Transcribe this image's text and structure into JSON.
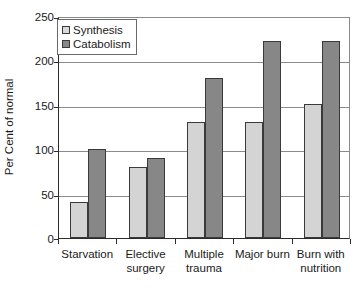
{
  "chart_data": {
    "type": "bar",
    "title": "",
    "xlabel": "",
    "ylabel": "Per Cent of normal",
    "ylim": [
      0,
      250
    ],
    "yticks": [
      0,
      50,
      100,
      150,
      200,
      250
    ],
    "grid": true,
    "legend_position": "top-left",
    "categories": [
      "Starvation",
      "Elective surgery",
      "Multiple trauma",
      "Major burn",
      "Burn with nutrition"
    ],
    "category_lines": [
      [
        "Starvation",
        ""
      ],
      [
        "Elective",
        "surgery"
      ],
      [
        "Multiple",
        "trauma"
      ],
      [
        "Major burn",
        ""
      ],
      [
        "Burn with",
        "nutrition"
      ]
    ],
    "series": [
      {
        "name": "Synthesis",
        "color": "#d4d4d4",
        "values": [
          40,
          80,
          131,
          131,
          151
        ]
      },
      {
        "name": "Catabolism",
        "color": "#878787",
        "values": [
          100,
          90,
          180,
          222,
          222
        ]
      }
    ]
  },
  "legend": {
    "items": [
      {
        "label": "Synthesis"
      },
      {
        "label": "Catabolism"
      }
    ]
  },
  "axis": {
    "y_title": "Per Cent of normal",
    "y_tick_labels": [
      "250",
      "200",
      "150",
      "100",
      "50",
      "0"
    ]
  }
}
